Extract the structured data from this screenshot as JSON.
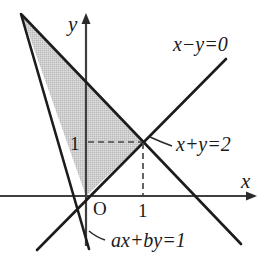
{
  "figure": {
    "type": "geometry-diagram",
    "background_color": "#ffffff",
    "line_color": "#1a1a1a",
    "axis_color": "#3a3a3a",
    "shade_fill": "#c9c9c9",
    "dash_color": "#555555"
  },
  "axes": {
    "x_axis_label": "x",
    "y_axis_label": "y",
    "origin_label": "O",
    "x_tick_label": "1",
    "y_tick_label": "1",
    "origin_px": {
      "x": 86,
      "y": 196
    },
    "unit_px": 57,
    "x_axis_start_px": {
      "x": 0,
      "y": 196
    },
    "x_axis_end_px": {
      "x": 257,
      "y": 196
    },
    "y_axis_start_px": {
      "x": 86,
      "y": 244
    },
    "y_axis_end_px": {
      "x": 86,
      "y": 14
    }
  },
  "lines": [
    {
      "name": "line-x-minus-y",
      "label": "x−y=0",
      "equation": "x - y = 0",
      "slope": 1,
      "intercept": 0,
      "label_px": {
        "x": 174,
        "y": 50
      },
      "p1_px": {
        "x": 37,
        "y": 250
      },
      "p2_px": {
        "x": 226,
        "y": 59
      }
    },
    {
      "name": "line-x-plus-y",
      "label": "x+y=2",
      "equation": "x + y = 2",
      "slope": -1,
      "intercept": 2,
      "label_px": {
        "x": 173,
        "y": 150
      },
      "p1_px": {
        "x": 22,
        "y": 15
      },
      "p2_px": {
        "x": 241,
        "y": 244
      },
      "leader_from_px": {
        "x": 170,
        "y": 144
      },
      "leader_to_px": {
        "x": 148,
        "y": 138
      }
    },
    {
      "name": "line-ax-plus-by",
      "label": "ax+by=1",
      "equation": "ax + by = 1",
      "label_px": {
        "x": 107,
        "y": 246
      },
      "p1_px": {
        "x": 21,
        "y": 14
      },
      "p2_px": {
        "x": 89,
        "y": 249
      },
      "leader_from_px": {
        "x": 104,
        "y": 240
      },
      "leader_to_px": {
        "x": 89,
        "y": 232
      }
    }
  ],
  "shaded_region": {
    "name": "feasible-triangle",
    "vertices_px": [
      {
        "x": 22,
        "y": 15
      },
      {
        "x": 143,
        "y": 142
      },
      {
        "x": 86,
        "y": 196
      }
    ],
    "vertex_labels": [
      "apex",
      "intersection (1,1)",
      "origin O"
    ]
  },
  "intersection_point": {
    "name": "point-1-1",
    "coords": {
      "x": 1,
      "y": 1
    },
    "px": {
      "x": 143,
      "y": 142
    }
  },
  "guides": [
    {
      "name": "horizontal-dashed-guide",
      "from_px": {
        "x": 88,
        "y": 142
      },
      "to_px": {
        "x": 143,
        "y": 142
      }
    },
    {
      "name": "vertical-dashed-guide",
      "from_px": {
        "x": 143,
        "y": 142
      },
      "to_px": {
        "x": 143,
        "y": 196
      }
    }
  ],
  "label_positions": {
    "origin_px": {
      "x": 93,
      "y": 214
    },
    "x_tick_px": {
      "x": 137,
      "y": 216
    },
    "y_tick_px": {
      "x": 70,
      "y": 150
    },
    "x_axis_name_px": {
      "x": 242,
      "y": 187
    },
    "y_axis_name_px": {
      "x": 68,
      "y": 30
    }
  }
}
